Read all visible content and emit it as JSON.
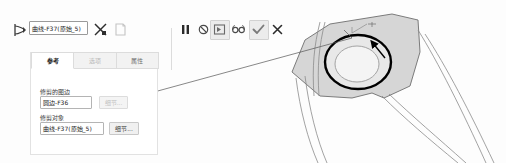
{
  "command_bar": {
    "selection_icon": "selection-arrow-icon",
    "field_value": "曲线-F37(原始_5)",
    "cut_icon": "cut-scissors-icon",
    "document_icon": "document-icon",
    "controls": [
      {
        "name": "pause-button",
        "icon": "pause-icon",
        "highlighted": false
      },
      {
        "name": "stop-button",
        "icon": "stop-circle-icon",
        "highlighted": false
      },
      {
        "name": "step-button",
        "icon": "step-forward-icon",
        "highlighted": true
      },
      {
        "name": "glasses-button",
        "icon": "glasses-icon",
        "highlighted": false
      },
      {
        "name": "confirm-button",
        "icon": "checkmark-icon",
        "highlighted": true
      },
      {
        "name": "cancel-button",
        "icon": "close-x-icon",
        "highlighted": false
      }
    ]
  },
  "dialog": {
    "tabs": [
      {
        "label": "参考",
        "active": true,
        "dimmed": false
      },
      {
        "label": "选项",
        "active": false,
        "dimmed": true
      },
      {
        "label": "属性",
        "active": false,
        "dimmed": false
      }
    ],
    "fields": [
      {
        "label": "修剪的图边",
        "value": "圆边-F36",
        "button_label": "细节...",
        "button_disabled": true
      },
      {
        "label": "修剪对象",
        "value": "曲线-F37(原始_5)",
        "button_label": "细节...",
        "button_disabled": false
      }
    ]
  },
  "viewport": {
    "model_name": "cad-3d-model",
    "highlighted_edge": "selected-circular-edge",
    "arrow_annotation": "direction-arrow",
    "leader_line": "selection-leader-line",
    "colors": {
      "surface_fill": "#d6d6d6",
      "outline": "#6e6e6e",
      "highlight_edge": "#000000",
      "leader": "#555555"
    }
  }
}
